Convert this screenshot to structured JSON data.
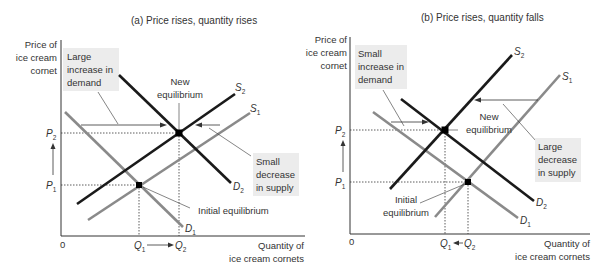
{
  "panels": [
    {
      "title": "(a) Price rises, quantity rises",
      "y_axis_label": [
        "Price of",
        "ice cream",
        "cornet"
      ],
      "x_axis_label": [
        "Quantity of",
        "ice cream cornets"
      ],
      "origin": "0",
      "price_labels": {
        "p1": "P",
        "p1_sub": "1",
        "p2": "P",
        "p2_sub": "2"
      },
      "quantity_labels": {
        "q1": "Q",
        "q1_sub": "1",
        "q2": "Q",
        "q2_sub": "2"
      },
      "curves": {
        "d1": "D",
        "d1_sub": "1",
        "d2": "D",
        "d2_sub": "2",
        "s1": "S",
        "s1_sub": "1",
        "s2": "S",
        "s2_sub": "2"
      },
      "annotations": {
        "demand_shift": [
          "Large",
          "increase in",
          "demand"
        ],
        "supply_shift": [
          "Small",
          "decrease",
          "in supply"
        ],
        "new_eq": [
          "New",
          "equilibrium"
        ],
        "initial_eq": [
          "Initial equilibrium"
        ]
      }
    },
    {
      "title": "(b) Price rises, quantity falls",
      "y_axis_label": [
        "Price of",
        "ice cream",
        "cornet"
      ],
      "x_axis_label": [
        "Quantity of",
        "ice cream cornets"
      ],
      "origin": "0",
      "price_labels": {
        "p1": "P",
        "p1_sub": "1",
        "p2": "P",
        "p2_sub": "2"
      },
      "quantity_labels": {
        "q1": "Q",
        "q1_sub": "1",
        "q2": "Q",
        "q2_sub": "2"
      },
      "curves": {
        "d1": "D",
        "d1_sub": "1",
        "d2": "D",
        "d2_sub": "2",
        "s1": "S",
        "s1_sub": "1",
        "s2": "S",
        "s2_sub": "2"
      },
      "annotations": {
        "demand_shift": [
          "Small",
          "increase in",
          "demand"
        ],
        "supply_shift": [
          "Large",
          "decrease",
          "in supply"
        ],
        "new_eq": [
          "New",
          "equilibrium"
        ],
        "initial_eq": [
          "Initial",
          "equilibrium"
        ]
      }
    }
  ],
  "colors": {
    "new_curve": "#1a1a1a",
    "old_curve": "#8a8a8a",
    "label_box": "#ececec",
    "text": "#333333"
  }
}
